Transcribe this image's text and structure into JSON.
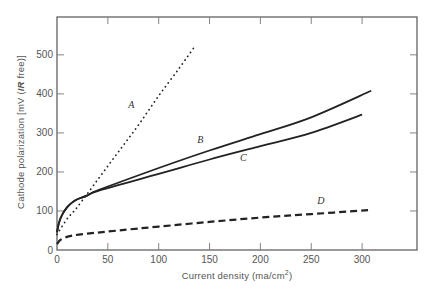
{
  "chart_data": {
    "type": "line",
    "title": "",
    "xlabel": "Current density (ma/cm²)",
    "xlabel_main": "Current density (ma/cm",
    "xlabel_sup": "2",
    "xlabel_end": ")",
    "ylabel": "Cathode polarization [mV (IR free)]",
    "ylabel_pre": "Cathode polarization  [mV  (",
    "ylabel_italic": "IR",
    "ylabel_post": " free)]",
    "xlim": [
      0,
      354
    ],
    "ylim": [
      0,
      597
    ],
    "x_ticks": [
      0,
      50,
      100,
      150,
      200,
      250,
      300
    ],
    "y_ticks": [
      0,
      100,
      200,
      300,
      400,
      500
    ],
    "x_tick_labels": [
      "0",
      "50",
      "100",
      "150",
      "200",
      "250",
      "300"
    ],
    "y_tick_labels": [
      "0",
      "100",
      "200",
      "300",
      "400",
      "500"
    ],
    "grid": false,
    "legend": "inline curve labels",
    "series": [
      {
        "name": "A",
        "style": "dotted",
        "x": [
          0,
          10,
          20,
          40,
          60,
          80,
          100,
          120,
          135
        ],
        "y": [
          40,
          80,
          110,
          180,
          250,
          320,
          395,
          465,
          520
        ],
        "label_pos": [
          70,
          365
        ]
      },
      {
        "name": "B",
        "style": "solid",
        "x": [
          0,
          2,
          5,
          10,
          15,
          20,
          25,
          30,
          42,
          100,
          150,
          200,
          250,
          309
        ],
        "y": [
          45,
          70,
          90,
          110,
          122,
          130,
          135,
          140,
          155,
          210,
          255,
          297,
          340,
          408
        ],
        "label_pos": [
          138,
          275
        ]
      },
      {
        "name": "C",
        "style": "solid",
        "x": [
          0,
          2,
          5,
          10,
          15,
          20,
          25,
          30,
          42,
          100,
          150,
          200,
          250,
          300
        ],
        "y": [
          45,
          70,
          90,
          110,
          122,
          130,
          135,
          140,
          153,
          195,
          232,
          266,
          300,
          347
        ],
        "label_pos": [
          180,
          228
        ]
      },
      {
        "name": "D",
        "style": "dashed",
        "x": [
          0,
          3,
          8,
          15,
          30,
          60,
          100,
          150,
          200,
          250,
          306
        ],
        "y": [
          15,
          25,
          32,
          37,
          42,
          50,
          60,
          72,
          83,
          92,
          102
        ],
        "label_pos": [
          256,
          117
        ]
      }
    ]
  },
  "labels": {
    "A": "A",
    "B": "B",
    "C": "C",
    "D": "D"
  }
}
